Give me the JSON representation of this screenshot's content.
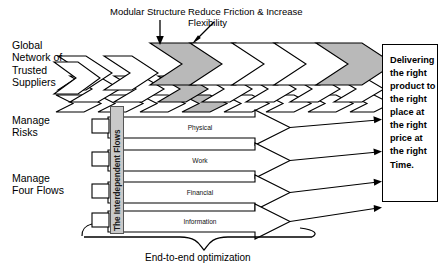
{
  "diagram": {
    "annotations": [
      {
        "id": "modular-structure",
        "text": "Modular Structure",
        "arrow": "down"
      },
      {
        "id": "reduce-friction",
        "text": "Reduce Friction & Increase\nFlexibility",
        "arrow": "diagonal"
      }
    ],
    "left_labels": [
      {
        "id": "global-network",
        "text": "Global\nNetwork of\nTrusted\nSuppliers"
      },
      {
        "id": "manage-risks",
        "text": "Manage\nRisks"
      },
      {
        "id": "manage-four-flows",
        "text": "Manage\nFour Flows"
      }
    ],
    "vertical_band": {
      "id": "interdependent-flows",
      "text": "The Interdependent Flows",
      "fill": "#c9c9c9"
    },
    "flows": [
      {
        "id": "flow-physical",
        "label": "Physical"
      },
      {
        "id": "flow-work",
        "label": "Work"
      },
      {
        "id": "flow-financial",
        "label": "Financial"
      },
      {
        "id": "flow-information",
        "label": "Information"
      }
    ],
    "outcome_box": {
      "id": "delivering-outcome",
      "text": "Delivering\nthe right\nproduct to\nthe right\nplace at\nthe right\nprice at\nthe right\nTime."
    },
    "caption": {
      "id": "end-to-end",
      "text": "End-to-end optimization"
    },
    "colors": {
      "stroke": "#000000",
      "chevron_fill_light": "#ffffff",
      "chevron_fill_shaded": "#b9b9b9",
      "band_fill": "#c9c9c9",
      "background": "#ffffff"
    }
  }
}
